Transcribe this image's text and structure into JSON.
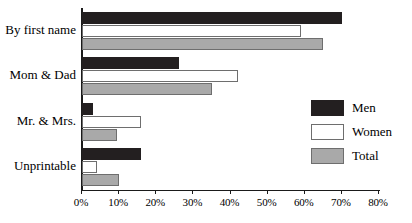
{
  "chart_data": {
    "type": "bar",
    "orientation": "horizontal",
    "title": "",
    "xlabel": "",
    "ylabel": "",
    "xlim": [
      0,
      80
    ],
    "grid": false,
    "legend_position": "right",
    "categories": [
      "By first name",
      "Mom & Dad",
      "Mr. & Mrs.",
      "Unprintable"
    ],
    "tick_labels": [
      "0%",
      "10%",
      "20%",
      "30%",
      "40%",
      "50%",
      "60%",
      "70%",
      "80%"
    ],
    "tick_values": [
      0,
      10,
      20,
      30,
      40,
      50,
      60,
      70,
      80
    ],
    "series": [
      {
        "name": "Men",
        "color": "#231f20",
        "values": [
          70,
          26,
          3,
          16
        ]
      },
      {
        "name": "Women",
        "color": "#ffffff",
        "values": [
          59,
          42,
          16,
          4
        ]
      },
      {
        "name": "Total",
        "color": "#a9a9a9",
        "values": [
          65,
          35,
          9.5,
          10
        ]
      }
    ]
  },
  "legend": {
    "items": [
      {
        "label": "Men"
      },
      {
        "label": "Women"
      },
      {
        "label": "Total"
      }
    ]
  }
}
